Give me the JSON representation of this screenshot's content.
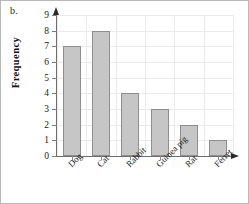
{
  "figure": {
    "panel_label": "b.",
    "border_color": "#b9b9b9",
    "background": "#ffffff"
  },
  "chart_data": {
    "type": "bar",
    "title": "",
    "subtitle": "",
    "xlabel": "",
    "ylabel": "Frequency",
    "categories": [
      "Dog",
      "Cat",
      "Rabbit",
      "Guinea pig",
      "Rat",
      "Ferret"
    ],
    "values": [
      7,
      8,
      4,
      3,
      2,
      1
    ],
    "ylim": [
      0,
      9
    ],
    "ytick_labels": [
      "0",
      "1",
      "2",
      "3",
      "4",
      "5",
      "6",
      "7",
      "8",
      "9"
    ],
    "ytick_values": [
      0,
      1,
      2,
      3,
      4,
      5,
      6,
      7,
      8,
      9
    ],
    "grid": true,
    "legend": false,
    "legend_position": "none",
    "bar_fill_color": "#c6c6c6",
    "bar_edge_color": "#8e8e8e",
    "axis_color": "#6e6e6e",
    "grid_color": "#eceaea",
    "xtick_label_rotation": -45,
    "axis_arrows": {
      "y_top": "arrow-up-icon",
      "x_right": "arrow-right-icon"
    }
  }
}
